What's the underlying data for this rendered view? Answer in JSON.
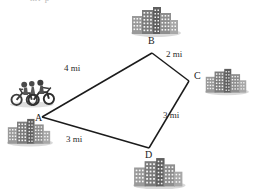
{
  "figure": {
    "title_partial": "mi  p",
    "vertices": [
      {
        "id": "A",
        "label": "A",
        "x": 42,
        "y": 117,
        "label_x": 35,
        "label_y": 119
      },
      {
        "id": "B",
        "label": "B",
        "x": 152,
        "y": 53,
        "label_x": 148,
        "label_y": 39
      },
      {
        "id": "C",
        "label": "C",
        "x": 189,
        "y": 81,
        "label_x": 194,
        "label_y": 73
      },
      {
        "id": "D",
        "label": "D",
        "x": 149,
        "y": 148,
        "label_x": 146,
        "label_y": 150
      }
    ],
    "edges": [
      {
        "from": "A",
        "to": "B",
        "label": "4 mi",
        "label_x": 76,
        "label_y": 67
      },
      {
        "from": "B",
        "to": "C",
        "label": "2 mi",
        "label_x": 172,
        "label_y": 54
      },
      {
        "from": "C",
        "to": "D",
        "label": "3 mi",
        "label_x": 166,
        "label_y": 114
      },
      {
        "from": "D",
        "to": "A",
        "label": "3 mi",
        "label_x": 72,
        "label_y": 137
      }
    ],
    "city_clusters": [
      {
        "at": "B",
        "name": "city-buildings-b",
        "x": 130,
        "y": 6,
        "w": 48,
        "h": 32
      },
      {
        "at": "C",
        "name": "city-buildings-c",
        "x": 204,
        "y": 68,
        "w": 44,
        "h": 28
      },
      {
        "at": "D",
        "name": "city-buildings-d",
        "x": 132,
        "y": 157,
        "w": 52,
        "h": 30
      },
      {
        "at": "A",
        "name": "city-buildings-a",
        "x": 6,
        "y": 118,
        "w": 44,
        "h": 30
      }
    ],
    "motorcycles": {
      "name": "motorcyclists",
      "x": 9,
      "y": 77,
      "w": 48,
      "h": 32
    },
    "colors": {
      "line": "#1b1b1b",
      "building_light": "#b7b7b7",
      "building_mid": "#8e8e8e",
      "building_dark": "#5f5f5f",
      "window": "#ffffff",
      "shadow": "#c9c9c9",
      "text": "#1a1a1a",
      "background": "#ffffff"
    }
  }
}
